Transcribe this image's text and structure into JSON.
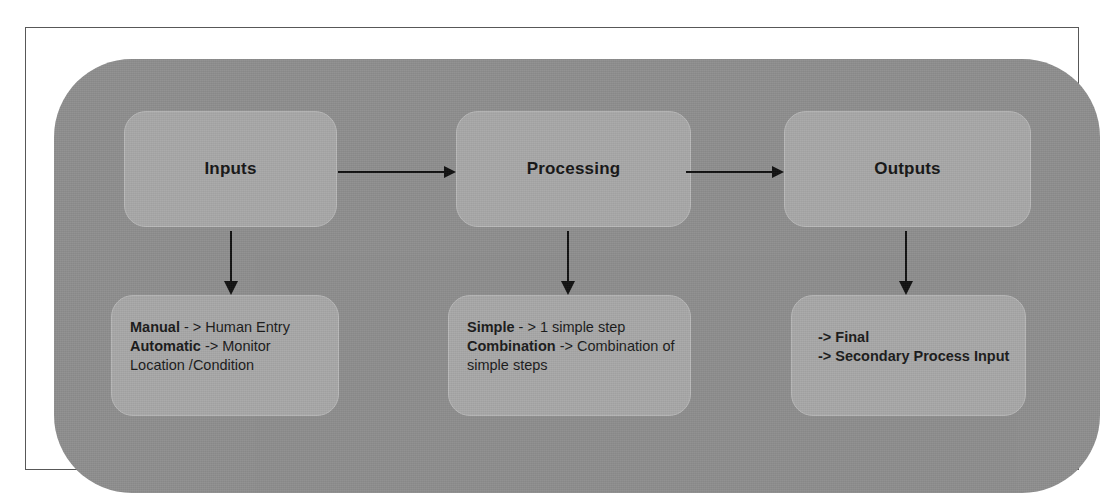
{
  "diagram": {
    "colors": {
      "panel_background": "#8e8e8e",
      "node_fill": "#a8a8a8",
      "node_border": "#b9b9b9",
      "arrow": "#111111",
      "text": "#1a1a1a",
      "frame_border": "#585858",
      "page_background": "#ffffff"
    },
    "columns": [
      {
        "id": "inputs",
        "header": "Inputs",
        "detail_lines": [
          {
            "bold_prefix": "Manual",
            "rest": " - > Human Entry"
          },
          {
            "bold_prefix": "Automatic",
            "rest": " -> Monitor"
          },
          {
            "bold_prefix": "",
            "rest": "Location /Condition"
          }
        ]
      },
      {
        "id": "processing",
        "header": "Processing",
        "detail_lines": [
          {
            "bold_prefix": "Simple",
            "rest": " - > 1 simple step"
          },
          {
            "bold_prefix": "Combination",
            "rest": " -> Combination of"
          },
          {
            "bold_prefix": "",
            "rest": "simple steps"
          }
        ]
      },
      {
        "id": "outputs",
        "header": "Outputs",
        "detail_lines": [
          {
            "bold_prefix": "-> Final",
            "rest": ""
          },
          {
            "bold_prefix": "-> Secondary Process Input",
            "rest": ""
          }
        ]
      }
    ],
    "connectors": [
      {
        "id": "inputs-to-processing",
        "kind": "arrow-right"
      },
      {
        "id": "processing-to-outputs",
        "kind": "arrow-right"
      },
      {
        "id": "inputs-to-inputs-detail",
        "kind": "arrow-down"
      },
      {
        "id": "processing-to-processing-detail",
        "kind": "arrow-down"
      },
      {
        "id": "outputs-to-outputs-detail",
        "kind": "arrow-down"
      }
    ]
  }
}
